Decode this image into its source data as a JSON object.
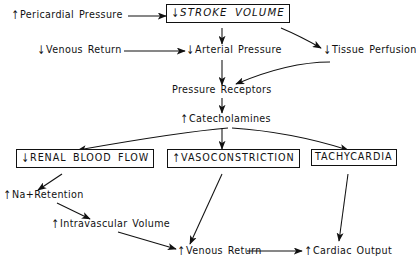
{
  "diagram": {
    "background_color": "#ffffff",
    "stroke_color": "#111111",
    "width": 416,
    "height": 264
  },
  "nodes": [
    {
      "id": "pericardial-pressure",
      "change": "↑",
      "change_direction": "up",
      "label": "Pericardial Pressure",
      "boxed": false,
      "italic": false
    },
    {
      "id": "stroke-volume",
      "change": "↓",
      "change_direction": "down",
      "label": "STROKE VOLUME",
      "boxed": true,
      "italic": true
    },
    {
      "id": "venous-return-top",
      "change": "↓",
      "change_direction": "down",
      "label": "Venous Return",
      "boxed": false,
      "italic": false
    },
    {
      "id": "arterial-pressure",
      "change": "↓",
      "change_direction": "down",
      "label": "Arterial Pressure",
      "boxed": false,
      "italic": false
    },
    {
      "id": "tissue-perfusion",
      "change": "↓",
      "change_direction": "down",
      "label": "Tissue Perfusion",
      "boxed": false,
      "italic": false
    },
    {
      "id": "pressure-receptors",
      "change": "",
      "change_direction": "none",
      "label": "Pressure Receptors",
      "boxed": false,
      "italic": false
    },
    {
      "id": "catecholamines",
      "change": "↑",
      "change_direction": "up",
      "label": "Catecholamines",
      "boxed": false,
      "italic": false
    },
    {
      "id": "renal-blood-flow",
      "change": "↓",
      "change_direction": "down",
      "label": "RENAL BLOOD FLOW",
      "boxed": true,
      "italic": false
    },
    {
      "id": "vasoconstriction",
      "change": "↑",
      "change_direction": "up",
      "label": "VASOCONSTRICTION",
      "boxed": true,
      "italic": false
    },
    {
      "id": "tachycardia",
      "change": "",
      "change_direction": "none",
      "label": "TACHYCARDIA",
      "boxed": true,
      "italic": false
    },
    {
      "id": "na-retention",
      "change": "↑",
      "change_direction": "up",
      "label_prefix": "Na",
      "label_superscript": "+",
      "label_suffix": " Retention",
      "label": "Na+ Retention",
      "boxed": false,
      "italic": false
    },
    {
      "id": "intravascular-volume",
      "change": "↑",
      "change_direction": "up",
      "label": "Intravascular Volume",
      "boxed": false,
      "italic": false
    },
    {
      "id": "venous-return-bottom",
      "change": "↑",
      "change_direction": "up",
      "label": "Venous Return",
      "boxed": false,
      "italic": false
    },
    {
      "id": "cardiac-output",
      "change": "↑",
      "change_direction": "up",
      "label": "Cardiac Output",
      "boxed": false,
      "italic": false
    }
  ],
  "edges": [
    {
      "from": "pericardial-pressure",
      "to": "stroke-volume"
    },
    {
      "from": "stroke-volume",
      "to": "arterial-pressure"
    },
    {
      "from": "stroke-volume",
      "to": "tissue-perfusion"
    },
    {
      "from": "venous-return-top",
      "to": "arterial-pressure"
    },
    {
      "from": "arterial-pressure",
      "to": "pressure-receptors"
    },
    {
      "from": "tissue-perfusion",
      "to": "pressure-receptors"
    },
    {
      "from": "pressure-receptors",
      "to": "catecholamines"
    },
    {
      "from": "catecholamines",
      "to": "renal-blood-flow"
    },
    {
      "from": "catecholamines",
      "to": "vasoconstriction"
    },
    {
      "from": "catecholamines",
      "to": "tachycardia"
    },
    {
      "from": "renal-blood-flow",
      "to": "na-retention"
    },
    {
      "from": "na-retention",
      "to": "intravascular-volume"
    },
    {
      "from": "intravascular-volume",
      "to": "venous-return-bottom"
    },
    {
      "from": "vasoconstriction",
      "to": "venous-return-bottom"
    },
    {
      "from": "venous-return-bottom",
      "to": "cardiac-output"
    },
    {
      "from": "tachycardia",
      "to": "cardiac-output"
    }
  ]
}
